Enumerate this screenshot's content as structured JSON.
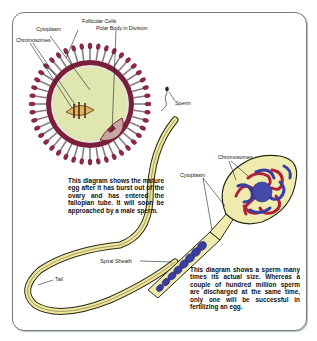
{
  "diagram": {
    "egg": {
      "labels": {
        "follicular_cells": "Follicular Cells",
        "cytoplasm": "Cytoplasm",
        "polar_body": "Polar Body in Division",
        "chromosomes": "Chromosomes"
      },
      "caption": "This diagram shows the mature egg after it has burst out of the ovary and has entered the fallopian tube. It will soon be approached by a male sperm."
    },
    "small_sperm": {
      "label": "Sperm"
    },
    "sperm": {
      "labels": {
        "chromosomes": "Chromosomes",
        "cytoplasm": "Cytoplasm",
        "spiral_sheath": "Spiral Sheath",
        "tail": "Tail"
      },
      "caption": "This diagram shows a sperm many times its actual size. Whereas a couple of hundred million sperm are discharged at the same time, only one will be successful in fertilizing an egg."
    },
    "colors": {
      "frame_border": "#6a7a8a",
      "zona_maroon": "#7a1f3a",
      "egg_cytoplasm": "#dfe6b0",
      "follicle_stalk": "#8a7c86",
      "follicle_head": "#8a2a4a",
      "sperm_body": "#f0ecb0",
      "chromosome_red": "#b0203a",
      "chromosome_blue": "#3a3ea0"
    }
  }
}
